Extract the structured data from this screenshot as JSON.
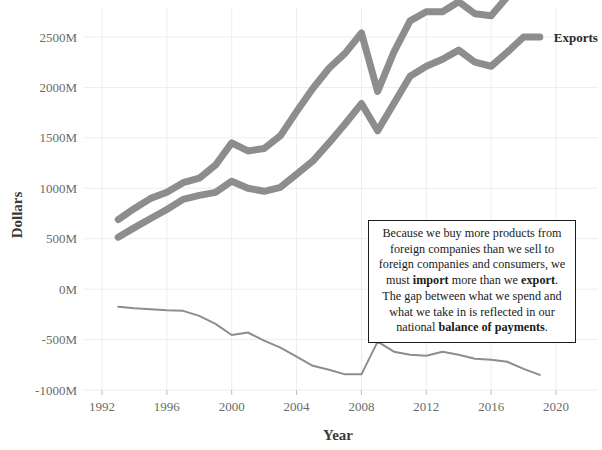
{
  "chart_data": {
    "type": "line",
    "title": "",
    "xlabel": "Year",
    "ylabel": "Dollars",
    "xlim": [
      1992,
      2020
    ],
    "ylim": [
      -1000,
      2500
    ],
    "grid": true,
    "legend_position": "inline-right-of-line-ends",
    "x_tick_labels": [
      "1992",
      "1996",
      "2000",
      "2004",
      "2008",
      "2012",
      "2016",
      "2020"
    ],
    "x_ticks": [
      1992,
      1996,
      2000,
      2004,
      2008,
      2012,
      2016,
      2020
    ],
    "y_tick_labels": [
      "2500M",
      "2000M",
      "1500M",
      "1000M",
      "500M",
      "0M",
      "-500M",
      "-1000M"
    ],
    "y_ticks": [
      2500,
      2000,
      1500,
      1000,
      500,
      0,
      -500,
      -1000
    ],
    "units": "Millions of Dollars",
    "x": [
      1993,
      1994,
      1995,
      1996,
      1997,
      1998,
      1999,
      2000,
      2001,
      2002,
      2003,
      2004,
      2005,
      2006,
      2007,
      2008,
      2009,
      2010,
      2011,
      2012,
      2013,
      2014,
      2015,
      2016,
      2017,
      2018,
      2019
    ],
    "series": [
      {
        "name": "Imports",
        "label": "Imports",
        "style": "thick",
        "color": "#8d8d8d",
        "values": [
          690,
          800,
          900,
          960,
          1055,
          1100,
          1230,
          1450,
          1370,
          1395,
          1520,
          1760,
          1990,
          2190,
          2340,
          2540,
          1960,
          2350,
          2660,
          2750,
          2750,
          2850,
          2730,
          2710,
          2900,
          3120,
          3100
        ]
      },
      {
        "name": "Exports",
        "label": "Exports",
        "style": "thick",
        "color": "#8d8d8d",
        "values": [
          515,
          610,
          700,
          790,
          890,
          930,
          960,
          1070,
          1000,
          970,
          1010,
          1140,
          1270,
          1450,
          1640,
          1840,
          1570,
          1840,
          2110,
          2210,
          2280,
          2370,
          2250,
          2210,
          2350,
          2500,
          2500
        ]
      },
      {
        "name": "Balance of Payments",
        "label": "Balance of Payments",
        "style": "thin",
        "color": "#8d8d8d",
        "values": [
          -175,
          -190,
          -200,
          -210,
          -215,
          -265,
          -345,
          -455,
          -430,
          -510,
          -580,
          -670,
          -760,
          -800,
          -845,
          -845,
          -520,
          -620,
          -650,
          -660,
          -620,
          -650,
          -690,
          -700,
          -720,
          -790,
          -850
        ]
      }
    ]
  },
  "annotation": {
    "name": "trade-deficit-explanation",
    "segments": [
      {
        "text": "Because we buy more products from foreign companies than we sell to foreign companies and consumers, we must ",
        "bold": false
      },
      {
        "text": "import",
        "bold": true
      },
      {
        "text": " more than we ",
        "bold": false
      },
      {
        "text": "export",
        "bold": true
      },
      {
        "text": ". The gap between what we spend and what we take in is reflected in our national ",
        "bold": false
      },
      {
        "text": "balance of payments",
        "bold": true
      },
      {
        "text": ".",
        "bold": false
      }
    ]
  }
}
